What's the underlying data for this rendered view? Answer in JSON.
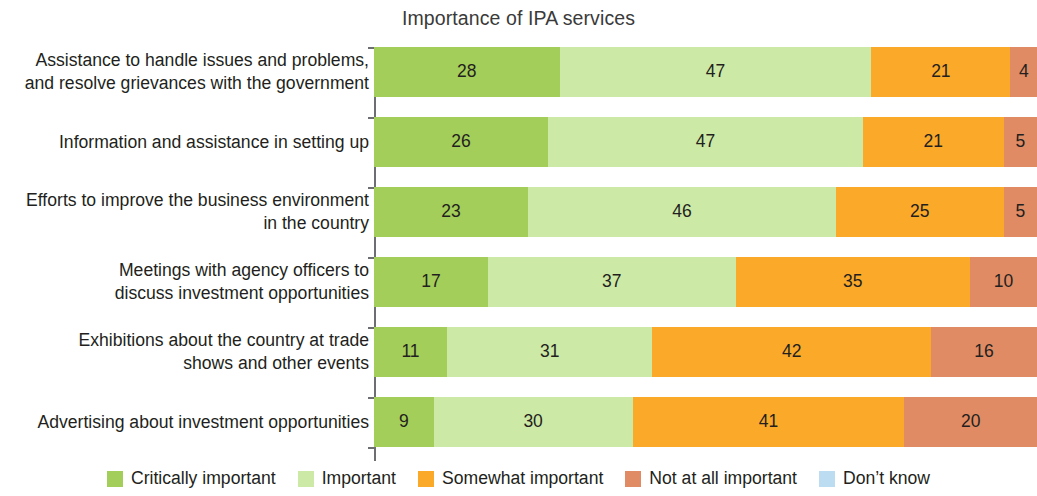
{
  "chart_data": {
    "type": "bar",
    "orientation": "horizontal",
    "stacked": true,
    "normalized_percent": true,
    "title": "Importance of IPA services",
    "xlabel": "",
    "ylabel": "",
    "xlim": [
      0,
      100
    ],
    "grid": false,
    "legend_position": "bottom",
    "categories": [
      "Assistance to handle issues and problems, and resolve grievances with the government",
      "Information and assistance in setting up",
      "Efforts to improve the business environment in the country",
      "Meetings with agency officers to discuss investment opportunities",
      "Exhibitions about the country at trade shows and other events",
      "Advertising about investment opportunities"
    ],
    "category_lines": [
      [
        "Assistance to handle issues and problems,",
        "and resolve grievances with the government"
      ],
      [
        "Information and assistance in setting up"
      ],
      [
        "Efforts to improve the business environment",
        "in the country"
      ],
      [
        "Meetings with agency officers to",
        "discuss investment opportunities"
      ],
      [
        "Exhibitions about the country at trade",
        "shows and other events"
      ],
      [
        "Advertising about investment opportunities"
      ]
    ],
    "series": [
      {
        "name": "Critically important",
        "color": "#a3ce59",
        "values": [
          28,
          26,
          23,
          17,
          11,
          9
        ]
      },
      {
        "name": "Important",
        "color": "#cde9a6",
        "values": [
          47,
          47,
          46,
          37,
          31,
          30
        ]
      },
      {
        "name": "Somewhat important",
        "color": "#fba929",
        "values": [
          21,
          21,
          25,
          35,
          42,
          41
        ]
      },
      {
        "name": "Not at all important",
        "color": "#e08b63",
        "values": [
          4,
          5,
          5,
          10,
          16,
          20
        ]
      },
      {
        "name": "Don't know",
        "color": "#bcdcf2",
        "values": [
          0,
          0,
          0,
          0,
          0,
          0
        ]
      }
    ],
    "value_labels": [
      [
        "28",
        "47",
        "21",
        "4",
        ""
      ],
      [
        "26",
        "47",
        "21",
        "5",
        ""
      ],
      [
        "23",
        "46",
        "25",
        "5",
        ""
      ],
      [
        "17",
        "37",
        "35",
        "10",
        ""
      ],
      [
        "11",
        "31",
        "42",
        "16",
        ""
      ],
      [
        "9",
        "30",
        "41",
        "20",
        ""
      ]
    ]
  },
  "legend": {
    "items": [
      {
        "label": "Critically important",
        "color": "#a3ce59"
      },
      {
        "label": "Important",
        "color": "#cde9a6"
      },
      {
        "label": "Somewhat important",
        "color": "#fba929"
      },
      {
        "label": "Not at all important",
        "color": "#e08b63"
      },
      {
        "label": "Don’t know",
        "color": "#bcdcf2"
      }
    ]
  },
  "axis": {
    "line_color": "#6d6e71"
  }
}
